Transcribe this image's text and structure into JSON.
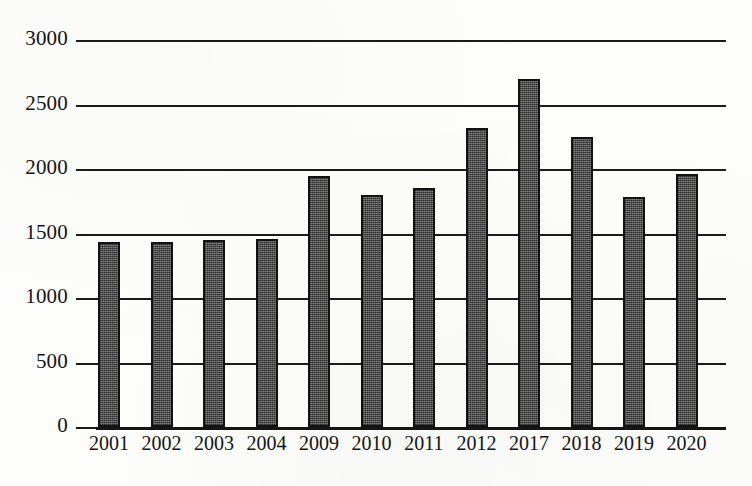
{
  "chart_data": {
    "type": "bar",
    "title": "",
    "subtitle": "",
    "xlabel": "",
    "ylabel": "",
    "categories": [
      "2001",
      "2002",
      "2003",
      "2004",
      "2009",
      "2010",
      "2011",
      "2012",
      "2017",
      "2018",
      "2019",
      "2020"
    ],
    "values": [
      1435,
      1435,
      1450,
      1455,
      1945,
      1795,
      1850,
      2320,
      2700,
      2245,
      1780,
      1960
    ],
    "series": [
      {
        "name": "",
        "values": [
          1435,
          1435,
          1450,
          1455,
          1945,
          1795,
          1850,
          2320,
          2700,
          2245,
          1780,
          1960
        ]
      }
    ],
    "ylim": [
      0,
      3000
    ],
    "ytick_labels": [
      "0",
      "500",
      "1000",
      "1500",
      "2000",
      "2500",
      "3000"
    ],
    "ytick_values": [
      0,
      500,
      1000,
      1500,
      2000,
      2500,
      3000
    ],
    "ytick_step": 500,
    "grid": true,
    "grid_axis": "y",
    "legend": false,
    "legend_position": "none",
    "annotations": [],
    "bar_color": "#595959",
    "bar_edge_color": "#121212",
    "axis_color": "#1b1b1b",
    "text_color": "#141414",
    "background_color": "#fdfdfb"
  }
}
